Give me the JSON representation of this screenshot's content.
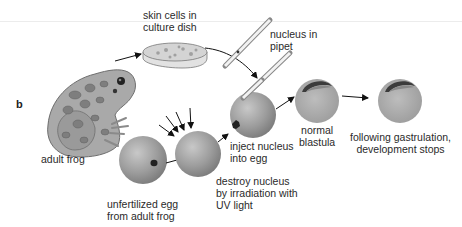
{
  "figure": {
    "panel_letter": "b",
    "labels": {
      "skin_cells": "skin cells in\nculture dish",
      "nucleus_pipet": "nucleus in\npipet",
      "adult_frog": "adult frog",
      "unfertilized_egg": "unfertilized egg\nfrom adult frog",
      "destroy_nucleus": "destroy nucleus\nby irradiation with\nUV light",
      "inject_nucleus": "inject nucleus\ninto egg",
      "normal_blastula": "normal\nblastula",
      "development_stops": "following gastrulation,\ndevelopment stops"
    },
    "colors": {
      "egg": "#9a9a9a",
      "egg_highlight": "#c4c4c4",
      "frog_body": "#a8a8a8",
      "frog_spots": "#7d7d7d",
      "arrow": "#111111",
      "blastocoel": "#3a3a3a"
    }
  }
}
